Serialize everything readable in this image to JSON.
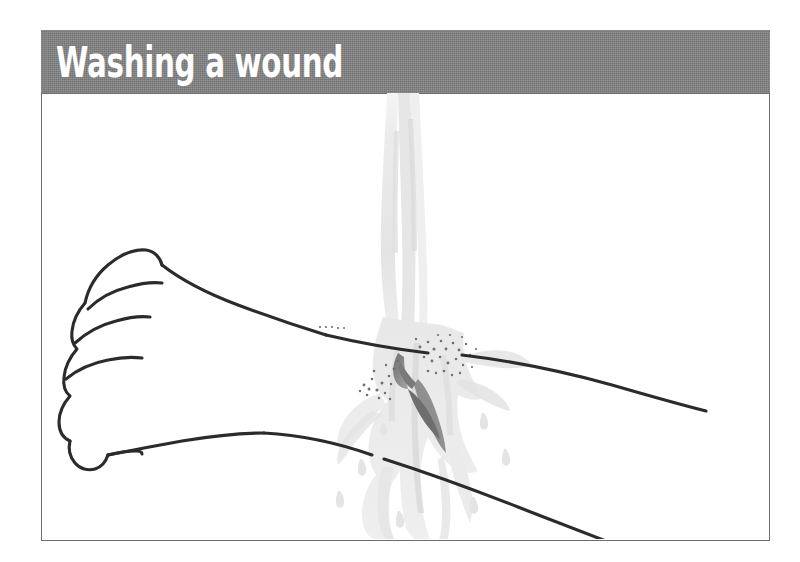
{
  "figure": {
    "title": "Washing a wound",
    "banner_color": "#818181",
    "banner_text_color": "#ffffff",
    "frame_border_color": "#6d6d6d",
    "background_color": "#ffffff"
  },
  "illustration": {
    "subject": "line drawing of a clenched fist and forearm being rinsed under running water at a cut on the wrist",
    "alt_text": "Washing a wound",
    "ink_color": "#2b2b2b",
    "water_color": "#e9e9e9",
    "water_shadow_color": "#d2d2d2",
    "wound_color": "#7d7d7d",
    "droplet_color": "#8a8a8a",
    "parts": [
      {
        "name": "fist",
        "label": "clenched fist"
      },
      {
        "name": "forearm",
        "label": "forearm"
      },
      {
        "name": "water-stream",
        "label": "running water stream"
      },
      {
        "name": "splash",
        "label": "water splash"
      },
      {
        "name": "wound",
        "label": "wound on wrist"
      },
      {
        "name": "droplets",
        "label": "scattered water droplets"
      }
    ]
  }
}
